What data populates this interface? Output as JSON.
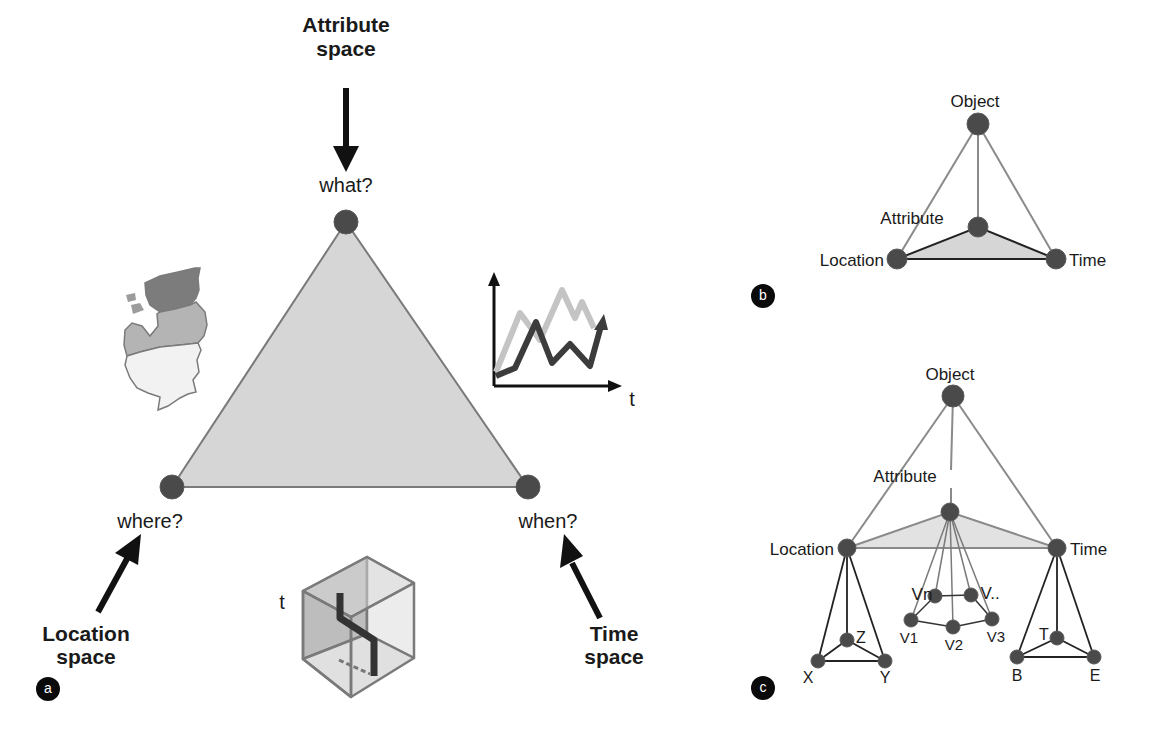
{
  "panel_a": {
    "badge": "a",
    "top_vertex": {
      "question": "what?",
      "space_line1": "Attribute",
      "space_line2": "space"
    },
    "left_vertex": {
      "question": "where?",
      "space_line1": "Location",
      "space_line2": "space"
    },
    "right_vertex": {
      "question": "when?",
      "space_line1": "Time",
      "space_line2": "space"
    },
    "chart_icon_axis_label": "t",
    "cube_icon_axis_label": "t",
    "map_icon": "baltic-states-map-icon"
  },
  "panel_b": {
    "badge": "b",
    "nodes": {
      "object": "Object",
      "attribute": "Attribute",
      "location": "Location",
      "time": "Time"
    }
  },
  "panel_c": {
    "badge": "c",
    "nodes": {
      "object": "Object",
      "attribute": "Attribute",
      "location": "Location",
      "time": "Time"
    },
    "location_children": [
      "X",
      "Y",
      "Z"
    ],
    "time_children": [
      "B",
      "E",
      "T"
    ],
    "attribute_children": [
      "V1",
      "V2",
      "V3",
      "Vn",
      "V.."
    ]
  },
  "colors": {
    "triangle_fill": "#d6d6d6",
    "triangle_stroke": "#7a7a7a",
    "node_fill": "#4a4a4a",
    "dark_line": "#222222",
    "light_line": "#8a8a8a"
  }
}
